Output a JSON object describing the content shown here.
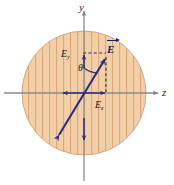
{
  "figure": {
    "type": "vector-diagram",
    "width": 174,
    "height": 185,
    "background": "#ffffff"
  },
  "region": {
    "shape": "circle",
    "center_x": 84,
    "center_y": 93,
    "radius": 62,
    "fill_color": "#f3cfa8",
    "hatch_color": "#dba77c",
    "hatch_orientation": "vertical",
    "hatch_spacing": 7,
    "edge_color": "#c9996c"
  },
  "axes": {
    "y_axis": {
      "label": "y",
      "orientation": "vertical",
      "x": 84,
      "y_start": 10,
      "y_end": 181,
      "color": "#8b8b8b"
    },
    "z_axis": {
      "label": "z",
      "orientation": "horizontal",
      "y": 93,
      "x_start": 4,
      "x_end": 160,
      "color": "#8b8b8b"
    },
    "origin_x": 84,
    "origin_y": 93
  },
  "vector": {
    "label": "E",
    "label_has_overarrow": true,
    "color": "#2b2d7d",
    "tip_x": 107,
    "tip_y": 56,
    "tail_x": 57,
    "tail_y": 138,
    "double_headed": true
  },
  "components": {
    "y_component": {
      "label": "E",
      "subscript": "y",
      "color": "#2b2d7d",
      "from_x": 84,
      "from_y": 93,
      "to_x": 84,
      "to_y": 53,
      "guide_style": "dashed"
    },
    "z_component": {
      "label": "E",
      "subscript": "z",
      "color": "#2b2d7d",
      "from_x": 84,
      "from_y": 93,
      "to_x": 107,
      "to_y": 93,
      "guide_style": "dashed"
    }
  },
  "angle": {
    "label": "θ",
    "between": [
      "y-axis",
      "E"
    ],
    "vertex_x": 84,
    "vertex_y": 93,
    "arc_radius": 26,
    "color": "#2b2d7d"
  },
  "guides": {
    "horizontal_dashed": {
      "x1": 84,
      "y1": 53,
      "x2": 107,
      "y2": 53,
      "color": "#2b2d7d"
    },
    "vertical_dashed": {
      "x1": 107,
      "y1": 56,
      "x2": 107,
      "y2": 93,
      "color": "#23232a"
    }
  }
}
